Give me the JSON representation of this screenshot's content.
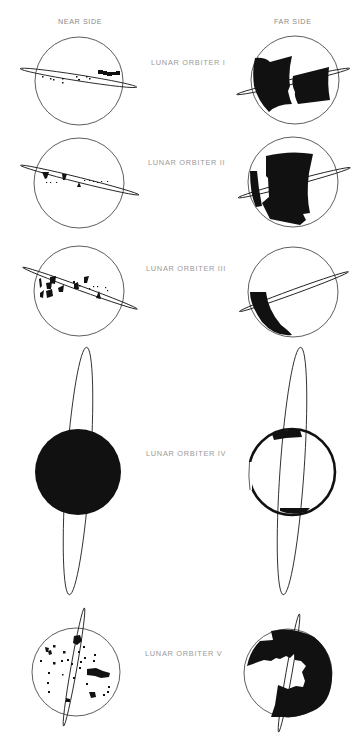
{
  "diagram": {
    "columns": [
      {
        "id": "near",
        "label": "NEAR SIDE"
      },
      {
        "id": "far",
        "label": "FAR SIDE"
      }
    ],
    "rows": [
      {
        "label": "LUNAR ORBITER I",
        "near_coverage": "scattered sites along equatorial band, larger cluster at east",
        "far_coverage": "two large blocks across equatorial region"
      },
      {
        "label": "LUNAR ORBITER II",
        "near_coverage": "scattered sites along equatorial band",
        "far_coverage": "large central block and western strip"
      },
      {
        "label": "LUNAR ORBITER III",
        "near_coverage": "clusters of sites in western equatorial region",
        "far_coverage": "crescent strip in southwest"
      },
      {
        "label": "LUNAR ORBITER IV",
        "near_coverage": "entire near side",
        "far_coverage": "limb rim regions, north and south caps"
      },
      {
        "label": "LUNAR ORBITER V",
        "near_coverage": "scattered sites over whole near side",
        "far_coverage": "majority of far side except western region"
      }
    ],
    "colors": {
      "coverage": "#111111",
      "outline": "#333333",
      "label": "#9a9a9a"
    }
  }
}
